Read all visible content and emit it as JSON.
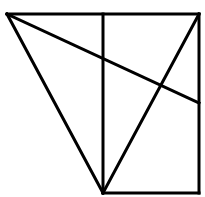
{
  "diagram": {
    "type": "geometric-figure",
    "stroke_color": "#000000",
    "background": "#ffffff",
    "points": {
      "A": [
        7,
        14
      ],
      "B": [
        103,
        14
      ],
      "C": [
        199,
        14
      ],
      "D": [
        103,
        193
      ],
      "E": [
        199,
        193
      ],
      "F": [
        199,
        103
      ]
    },
    "segments": [
      {
        "name": "top-edge",
        "from": "A",
        "to": "C"
      },
      {
        "name": "right-edge",
        "from": "C",
        "to": "E"
      },
      {
        "name": "bottom-edge",
        "from": "D",
        "to": "E"
      },
      {
        "name": "vertical-midline",
        "from": "B",
        "to": "D"
      },
      {
        "name": "left-slant",
        "from": "A",
        "to": "D"
      },
      {
        "name": "right-slant",
        "from": "D",
        "to": "C"
      },
      {
        "name": "long-diagonal",
        "from": "A",
        "to": "F"
      }
    ]
  }
}
